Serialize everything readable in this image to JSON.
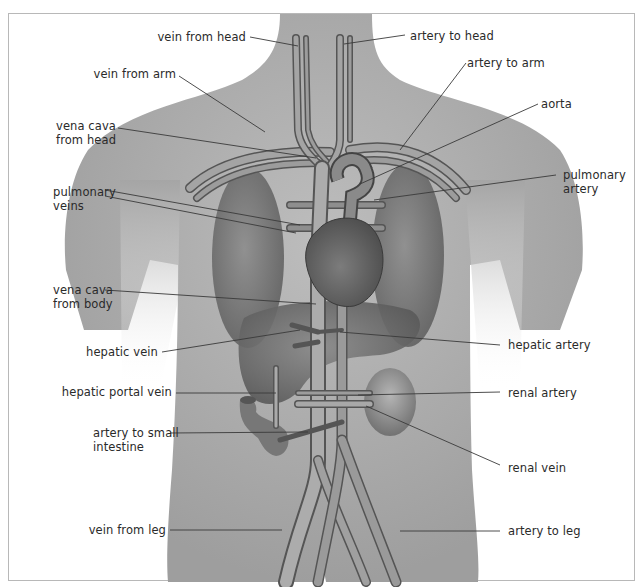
{
  "diagram": {
    "colors": {
      "body": "#a9a9a9",
      "body_light": "#c4c4c4",
      "organ": "#6e6e6e",
      "vessel": "#9a9a9a",
      "vessel_edge": "#555555",
      "leader_line": "#3a3a3a",
      "frame": "#b8b8b8",
      "text": "#2a2a2a"
    },
    "labels_left": [
      {
        "id": "vein-from-head",
        "text": "vein from head"
      },
      {
        "id": "vein-from-arm",
        "text": "vein from arm"
      },
      {
        "id": "vena-cava-from-head",
        "text": "vena cava\nfrom head"
      },
      {
        "id": "pulmonary-veins",
        "text": "pulmonary\nveins"
      },
      {
        "id": "vena-cava-from-body",
        "text": "vena cava\nfrom body"
      },
      {
        "id": "hepatic-vein",
        "text": "hepatic vein"
      },
      {
        "id": "hepatic-portal-vein",
        "text": "hepatic portal vein"
      },
      {
        "id": "artery-to-small-intestine",
        "text": "artery to small\nintestine"
      },
      {
        "id": "vein-from-leg",
        "text": "vein from leg"
      }
    ],
    "labels_right": [
      {
        "id": "artery-to-head",
        "text": "artery to head"
      },
      {
        "id": "artery-to-arm",
        "text": "artery to arm"
      },
      {
        "id": "aorta",
        "text": "aorta"
      },
      {
        "id": "pulmonary-artery",
        "text": "pulmonary\nartery"
      },
      {
        "id": "hepatic-artery",
        "text": "hepatic artery"
      },
      {
        "id": "renal-artery",
        "text": "renal artery"
      },
      {
        "id": "renal-vein",
        "text": "renal vein"
      },
      {
        "id": "artery-to-leg",
        "text": "artery to leg"
      }
    ]
  }
}
